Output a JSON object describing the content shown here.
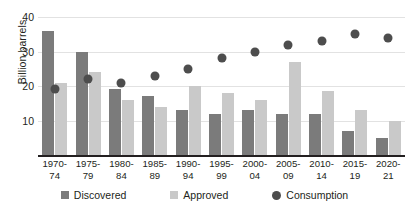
{
  "chart_data": {
    "type": "bar",
    "title": "",
    "xlabel": "",
    "ylabel": "Billion barrels",
    "ylim": [
      0,
      40
    ],
    "yticks": [
      10,
      20,
      30,
      40
    ],
    "grid": true,
    "legend_position": "bottom",
    "categories": [
      "1970-74",
      "1975-79",
      "1980-84",
      "1985-89",
      "1990-94",
      "1995-99",
      "2000-04",
      "2005-09",
      "2010-14",
      "2015-19",
      "2020-21"
    ],
    "category_lines": [
      [
        "1970-",
        "74"
      ],
      [
        "1975-",
        "79"
      ],
      [
        "1980-",
        "84"
      ],
      [
        "1985-",
        "89"
      ],
      [
        "1990-",
        "94"
      ],
      [
        "1995-",
        "99"
      ],
      [
        "2000-",
        "04"
      ],
      [
        "2005-",
        "09"
      ],
      [
        "2010-",
        "14"
      ],
      [
        "2015-",
        "19"
      ],
      [
        "2020-",
        "21"
      ]
    ],
    "series": [
      {
        "name": "Discovered",
        "kind": "bar",
        "color": "#7b7b7b",
        "values": [
          36,
          30,
          19,
          17,
          13,
          12,
          13,
          12,
          12,
          7,
          5
        ]
      },
      {
        "name": "Approved",
        "kind": "bar",
        "color": "#c9c9c9",
        "values": [
          21,
          24,
          16,
          14,
          20,
          18,
          16,
          27,
          18.5,
          13,
          10
        ]
      },
      {
        "name": "Consumption",
        "kind": "scatter",
        "color": "#4d4d4d",
        "values": [
          19,
          22,
          21,
          23,
          25,
          28,
          30,
          32,
          33,
          35,
          34
        ]
      }
    ]
  },
  "legend": {
    "items": [
      {
        "label": "Discovered",
        "marker": "square-swatch-dark",
        "color": "#7b7b7b"
      },
      {
        "label": "Approved",
        "marker": "square-swatch-light",
        "color": "#c9c9c9"
      },
      {
        "label": "Consumption",
        "marker": "circle-swatch-dark",
        "color": "#4d4d4d"
      }
    ]
  }
}
